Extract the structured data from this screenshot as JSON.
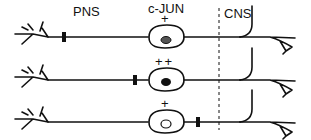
{
  "labels": {
    "pns": "PNS",
    "cjun": "c-JUN",
    "cns": "CNS"
  },
  "colors": {
    "ink": "#111111",
    "background": "#ffffff",
    "nucleus_grey": "#555555"
  },
  "neurons": [
    {
      "id": 1,
      "cjun_level": "+",
      "lesion_position": "distal-pns",
      "nucleus": "grey-filled"
    },
    {
      "id": 2,
      "cjun_level": "++",
      "lesion_position": "proximal-near-soma",
      "nucleus": "black-filled"
    },
    {
      "id": 3,
      "cjun_level": "+",
      "lesion_position": "central-near-cns-boundary",
      "nucleus": "open"
    }
  ]
}
